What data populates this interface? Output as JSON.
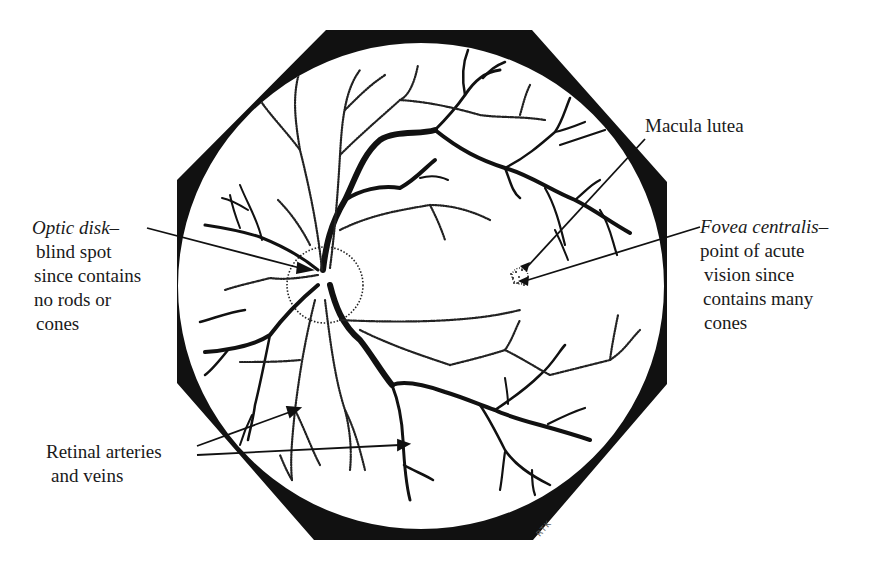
{
  "diagram": {
    "labels": {
      "optic_disk": {
        "title": "Optic disk–",
        "lines": [
          "blind spot",
          "since contains",
          "no rods or",
          "cones"
        ]
      },
      "macula_lutea": {
        "title": "Macula lutea"
      },
      "fovea_centralis": {
        "title": "Fovea centralis–",
        "lines": [
          "point of acute",
          "vision since",
          "contains many",
          "cones"
        ]
      },
      "retinal_vessels": {
        "lines": [
          "Retinal arteries",
          "and veins"
        ]
      }
    },
    "signature": "RTK",
    "colors": {
      "ink": "#111111",
      "background": "#ffffff",
      "label_text": "#1a1a1a"
    }
  }
}
